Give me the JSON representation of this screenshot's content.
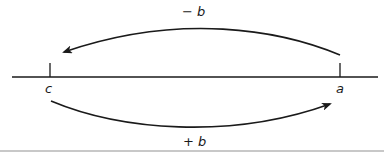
{
  "diagram": {
    "type": "number-line",
    "points": [
      {
        "id": "c",
        "label": "c",
        "x": 50
      },
      {
        "id": "a",
        "label": "a",
        "x": 340
      }
    ],
    "arrows": [
      {
        "id": "top-arrow",
        "from": "a",
        "to": "c",
        "label": "− b",
        "direction": "left"
      },
      {
        "id": "bottom-arrow",
        "from": "c",
        "to": "a",
        "label": "+ b",
        "direction": "right"
      }
    ],
    "colors": {
      "stroke": "#1a1a1a",
      "rule": "#c8c8c8",
      "background": "#ffffff"
    }
  }
}
